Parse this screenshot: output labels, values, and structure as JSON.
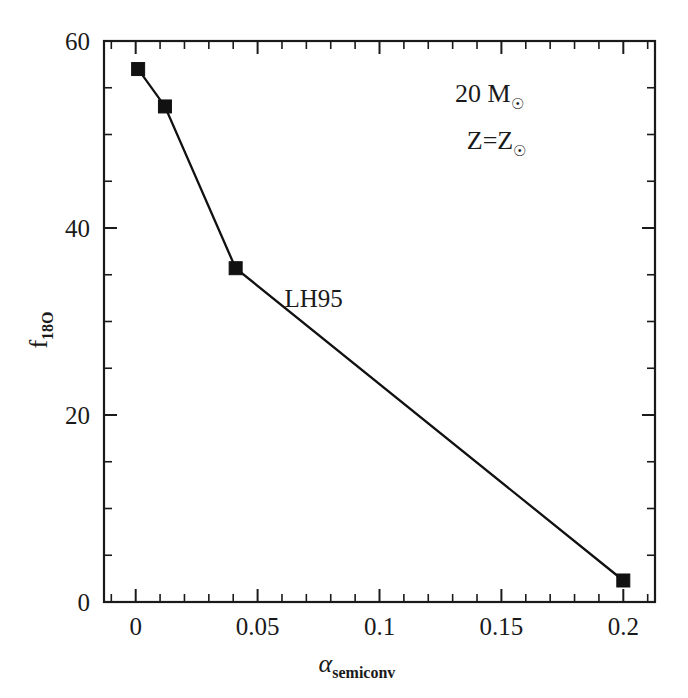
{
  "chart_data": {
    "type": "line",
    "title": "",
    "subtitle": "",
    "xlabel": "alpha_semiconv",
    "xlabel_base": "α",
    "xlabel_sub": "semiconv",
    "ylabel": "f_18O",
    "ylabel_base": "f",
    "ylabel_sub": "18O",
    "xlim": [
      -0.013,
      0.213
    ],
    "ylim": [
      0,
      60
    ],
    "xticks": [
      0,
      0.05,
      0.1,
      0.15,
      0.2
    ],
    "xticklabels": [
      "0",
      "0.05",
      "0.1",
      "0.15",
      "0.2"
    ],
    "xminor_step": 0.01,
    "yticks": [
      0,
      20,
      40,
      60
    ],
    "yticklabels": [
      "0",
      "20",
      "40",
      "60"
    ],
    "yminor_step": 5,
    "grid": false,
    "legend_position": "none",
    "series": [
      {
        "name": "LH95",
        "marker": "filled-square",
        "x": [
          0.001,
          0.012,
          0.041,
          0.2
        ],
        "y": [
          57.0,
          53.0,
          35.7,
          2.3
        ]
      }
    ],
    "annotations": [
      {
        "name": "mass-annotation",
        "text": "20 M",
        "sub": "☉",
        "x": 0.145,
        "y": 53.5
      },
      {
        "name": "metallicity-annotation",
        "text": "Z=Z",
        "sub": "☉",
        "x": 0.148,
        "y": 48.5
      },
      {
        "name": "series-label-lh95",
        "text": "LH95",
        "x": 0.073,
        "y": 31.5
      }
    ]
  },
  "figure": {
    "background": "#ffffff",
    "ink": "#1a1a1a"
  }
}
